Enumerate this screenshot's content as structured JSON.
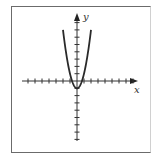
{
  "figure": {
    "x_axis_label": "x",
    "y_axis_label": "y",
    "frame_color": "#6b6b6b",
    "line_color": "#2a2a2a"
  },
  "chart_data": {
    "type": "line",
    "title": "",
    "xlabel": "x",
    "ylabel": "y",
    "equation_estimate": "y = 2x^2 - 1 (tick units)",
    "vertex": [
      0,
      -1
    ],
    "x_intercepts": [
      -0.7,
      0.7
    ],
    "x": [
      -2,
      -1.5,
      -1,
      -0.5,
      0,
      0.5,
      1,
      1.5,
      2
    ],
    "series": [
      {
        "name": "parabola",
        "values": [
          7,
          3.5,
          1,
          -0.5,
          -1,
          -0.5,
          1,
          3.5,
          7
        ]
      }
    ],
    "xlim": [
      -8,
      8
    ],
    "ylim": [
      -8,
      9
    ],
    "x_ticks": [
      -7,
      -6,
      -5,
      -4,
      -3,
      -2,
      -1,
      1,
      2,
      3,
      4,
      5,
      6,
      7,
      8
    ],
    "y_ticks": [
      -8,
      -7,
      -6,
      -5,
      -4,
      -3,
      -2,
      -1,
      1,
      2,
      3,
      4,
      5,
      6,
      7,
      8
    ],
    "tick_labels": false,
    "grid": false,
    "legend": false
  }
}
